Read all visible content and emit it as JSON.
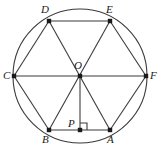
{
  "figure": {
    "name": "regular-hexagon-inscribed-in-circle",
    "stroke_color": "#3b3b3b",
    "label_color": "#1a1a1a",
    "background_color": "#ffffff",
    "canvas": {
      "width": 162,
      "height": 154
    },
    "circle": {
      "center_label": "O",
      "center": {
        "x": 80,
        "y": 76
      },
      "radius": 67
    },
    "points": [
      {
        "id": "A",
        "label": "A",
        "x": 110,
        "y": 130,
        "label_x": 107,
        "label_y": 134
      },
      {
        "id": "B",
        "label": "B",
        "x": 49,
        "y": 130,
        "label_x": 42,
        "label_y": 134
      },
      {
        "id": "C",
        "label": "C",
        "x": 14,
        "y": 76,
        "label_x": 3,
        "label_y": 70
      },
      {
        "id": "D",
        "label": "D",
        "x": 49,
        "y": 21,
        "label_x": 41,
        "label_y": 4
      },
      {
        "id": "E",
        "label": "E",
        "x": 110,
        "y": 21,
        "label_x": 106,
        "label_y": 4
      },
      {
        "id": "F",
        "label": "F",
        "x": 146,
        "y": 76,
        "label_x": 150,
        "label_y": 70
      },
      {
        "id": "O",
        "label": "O",
        "x": 80,
        "y": 76,
        "label_x": 74,
        "label_y": 60
      },
      {
        "id": "P",
        "label": "P",
        "x": 80,
        "y": 130,
        "label_x": 68,
        "label_y": 118
      }
    ],
    "segments": [
      {
        "name": "side-AB",
        "from": "A",
        "to": "B"
      },
      {
        "name": "side-BC",
        "from": "B",
        "to": "C"
      },
      {
        "name": "side-CD",
        "from": "C",
        "to": "D"
      },
      {
        "name": "side-DE",
        "from": "D",
        "to": "E"
      },
      {
        "name": "side-EF",
        "from": "E",
        "to": "F"
      },
      {
        "name": "side-FA",
        "from": "F",
        "to": "A"
      },
      {
        "name": "diagonal-CF",
        "from": "C",
        "to": "F"
      },
      {
        "name": "diagonal-BE",
        "from": "B",
        "to": "E"
      },
      {
        "name": "diagonal-AD",
        "from": "A",
        "to": "D"
      },
      {
        "name": "perpendicular-OP",
        "from": "O",
        "to": "P"
      }
    ],
    "right_angle": {
      "name": "right-angle-at-P",
      "vertex": "P",
      "size": 7,
      "direction": "upper-right"
    }
  }
}
